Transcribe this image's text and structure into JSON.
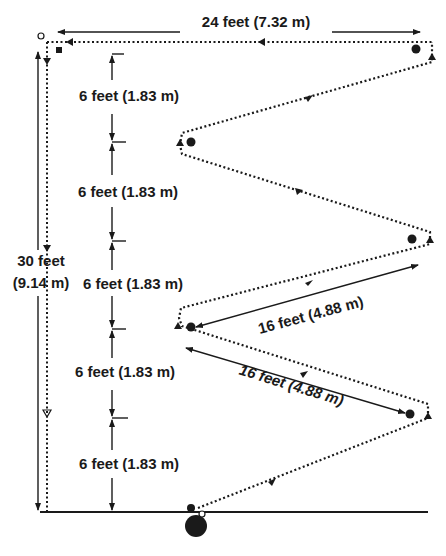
{
  "labels": {
    "width_top": "24 feet (7.32 m)",
    "height_total_line1": "30 feet",
    "height_total_line2": "(9.14 m)",
    "seg1": "6 feet (1.83 m)",
    "seg2": "6 feet (1.83 m)",
    "seg3": "6 feet (1.83 m)",
    "seg4": "6 feet (1.83 m)",
    "seg5": "6 feet (1.83 m)",
    "diag_upper": "16 feet (4.88 m)",
    "diag_lower": "16 feet (4.88 m)"
  },
  "colors": {
    "ink": "#1a1a1a",
    "background": "#ffffff"
  },
  "markers": {
    "start_ball": "large filled circle at bottom (start)",
    "cones": [
      "top-right",
      "upper-left turn",
      "middle-right",
      "middle-left turn",
      "lower-right"
    ],
    "end_square": "small filled square top-left",
    "open_circle": "small open circle top-left corner"
  }
}
